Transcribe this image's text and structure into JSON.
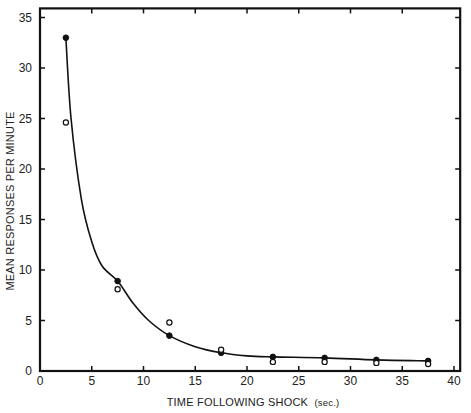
{
  "chart_data": {
    "type": "scatter",
    "title": "",
    "xlabel": "TIME FOLLOWING SHOCK",
    "xlabel_unit": "(sec.)",
    "ylabel": "MEAN RESPONSES PER MINUTE",
    "xlim": [
      0,
      40.5
    ],
    "ylim": [
      0,
      36
    ],
    "x_ticks": [
      0,
      5,
      10,
      15,
      20,
      25,
      30,
      35,
      40
    ],
    "y_ticks": [
      0,
      5,
      10,
      15,
      20,
      25,
      30,
      35
    ],
    "grid": false,
    "legend": null,
    "x": [
      2.5,
      7.5,
      12.5,
      17.5,
      22.5,
      27.5,
      32.5,
      37.5
    ],
    "series": [
      {
        "name": "filled",
        "marker": "filled-circle",
        "values": [
          33.0,
          8.9,
          3.5,
          1.8,
          1.4,
          1.3,
          1.1,
          1.0
        ]
      },
      {
        "name": "open",
        "marker": "open-circle",
        "values": [
          24.6,
          8.1,
          4.8,
          2.1,
          0.9,
          0.9,
          0.8,
          0.7
        ]
      }
    ],
    "fit_curve": {
      "description": "smooth decreasing curve through filled points",
      "x": [
        2.5,
        3,
        4,
        5,
        6,
        7.5,
        9,
        10.5,
        12.5,
        15,
        17.5,
        20,
        22.5,
        27.5,
        32.5,
        37.5
      ],
      "y": [
        33.0,
        25.0,
        17.0,
        12.8,
        10.4,
        8.9,
        6.7,
        5.0,
        3.5,
        2.4,
        1.8,
        1.5,
        1.4,
        1.3,
        1.1,
        1.0
      ]
    }
  }
}
